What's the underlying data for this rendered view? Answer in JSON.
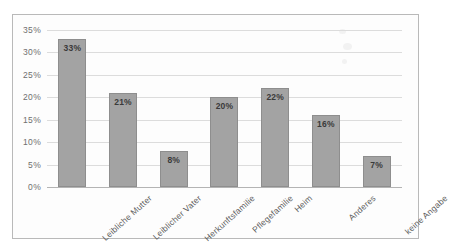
{
  "chart_data": {
    "type": "bar",
    "title": "",
    "subtitle": "",
    "xlabel": "",
    "ylabel": "",
    "categories": [
      "Leibliche Mutter",
      "Leiblicher Vater",
      "Herkunftsfamilie",
      "Pflegefamilie",
      "Heim",
      "Anderes",
      "keine Angabe"
    ],
    "values": [
      33,
      21,
      8,
      20,
      22,
      16,
      7
    ],
    "data_labels": [
      "33%",
      "21%",
      "8%",
      "20%",
      "22%",
      "16%",
      "7%"
    ],
    "ylim": [
      0,
      35
    ],
    "ytick_values": [
      0,
      5,
      10,
      15,
      20,
      25,
      30,
      35
    ],
    "ytick_labels": [
      "0%",
      "5%",
      "10%",
      "15%",
      "20%",
      "25%",
      "30%",
      "35%"
    ],
    "grid": true,
    "legend": false,
    "legend_position": "none",
    "bar_color": "#a3a3a3",
    "bar_border_color": "#8e8e8e",
    "gridline_color": "#dcdcdc",
    "axis_color": "#b4b4b4",
    "frame_border_color": "#b9b9b9",
    "plot_background": "#fdfdfd",
    "label_rotation_degrees": -42
  }
}
